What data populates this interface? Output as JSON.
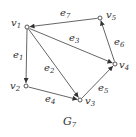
{
  "caption": {
    "base": "G",
    "sub": "7"
  },
  "colors": {
    "stroke": "#444444",
    "node_fill": "#ffffff",
    "text": "#333333"
  },
  "nodes": [
    {
      "id": "v1",
      "base": "v",
      "sub": "1",
      "x": 27,
      "y": 27
    },
    {
      "id": "v2",
      "base": "v",
      "sub": "2",
      "x": 26,
      "y": 86
    },
    {
      "id": "v3",
      "base": "v",
      "sub": "3",
      "x": 80,
      "y": 100
    },
    {
      "id": "v4",
      "base": "v",
      "sub": "4",
      "x": 115,
      "y": 64
    },
    {
      "id": "v5",
      "base": "v",
      "sub": "5",
      "x": 100,
      "y": 18
    }
  ],
  "edges": [
    {
      "id": "e1",
      "base": "e",
      "sub": "1",
      "from": "v1",
      "to": "v2"
    },
    {
      "id": "e2",
      "base": "e",
      "sub": "2",
      "from": "v1",
      "to": "v3"
    },
    {
      "id": "e3",
      "base": "e",
      "sub": "3",
      "from": "v1",
      "to": "v4"
    },
    {
      "id": "e4",
      "base": "e",
      "sub": "4",
      "from": "v2",
      "to": "v3"
    },
    {
      "id": "e5",
      "base": "e",
      "sub": "5",
      "from": "v3",
      "to": "v4"
    },
    {
      "id": "e6",
      "base": "e",
      "sub": "6",
      "from": "v4",
      "to": "v5"
    },
    {
      "id": "e7",
      "base": "e",
      "sub": "7",
      "from": "v5",
      "to": "v1"
    }
  ]
}
